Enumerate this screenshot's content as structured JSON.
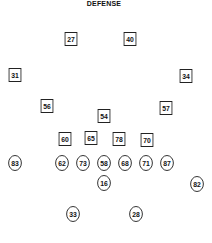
{
  "title": "DEFENSE",
  "defense": [
    {
      "number": "27",
      "x": 71,
      "y": 39
    },
    {
      "number": "40",
      "x": 130,
      "y": 39
    },
    {
      "number": "31",
      "x": 15,
      "y": 75
    },
    {
      "number": "34",
      "x": 186,
      "y": 76
    },
    {
      "number": "56",
      "x": 47,
      "y": 106
    },
    {
      "number": "57",
      "x": 166,
      "y": 108
    },
    {
      "number": "54",
      "x": 104,
      "y": 116
    },
    {
      "number": "60",
      "x": 65,
      "y": 139
    },
    {
      "number": "65",
      "x": 91,
      "y": 138
    },
    {
      "number": "78",
      "x": 119,
      "y": 139
    },
    {
      "number": "70",
      "x": 147,
      "y": 140
    }
  ],
  "offense": [
    {
      "number": "83",
      "x": 15,
      "y": 163
    },
    {
      "number": "62",
      "x": 62,
      "y": 163
    },
    {
      "number": "73",
      "x": 83,
      "y": 163
    },
    {
      "number": "58",
      "x": 104,
      "y": 163
    },
    {
      "number": "68",
      "x": 125,
      "y": 163
    },
    {
      "number": "71",
      "x": 146,
      "y": 163
    },
    {
      "number": "87",
      "x": 167,
      "y": 163
    },
    {
      "number": "16",
      "x": 104,
      "y": 183
    },
    {
      "number": "82",
      "x": 197,
      "y": 184
    },
    {
      "number": "33",
      "x": 73,
      "y": 214
    },
    {
      "number": "28",
      "x": 136,
      "y": 214
    }
  ],
  "legend": {
    "square": "defensive player",
    "circle": "offensive player"
  }
}
